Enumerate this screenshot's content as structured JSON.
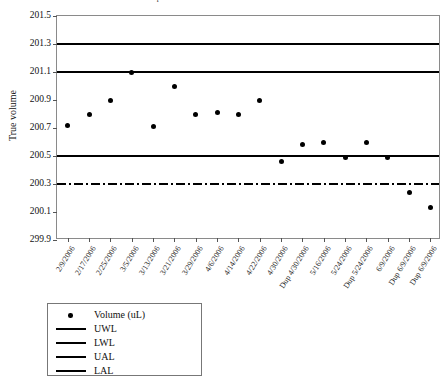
{
  "chart_data": {
    "type": "scatter",
    "title": "Pipette Performance Control Chart - Jan 2006",
    "xlabel": "",
    "ylabel": "True volume",
    "ylim": [
      199.9,
      201.5
    ],
    "ytick_labels": [
      "201.5",
      "201.3",
      "201.1",
      "200.9",
      "200.7",
      "200.5",
      "200.3",
      "200.1",
      "299.9"
    ],
    "ytick_values": [
      201.5,
      201.3,
      201.1,
      200.9,
      200.7,
      200.5,
      200.3,
      200.1,
      199.9
    ],
    "grid": false,
    "legend_position": "below-left",
    "categories": [
      "2/9/2006",
      "2/17/2006",
      "2/25/2006",
      "3/5/2006",
      "3/13/2006",
      "3/21/2006",
      "3/29/2006",
      "4/6/2006",
      "4/14/2006",
      "4/22/2006",
      "4/30/2006",
      "Dup 4/30/2006",
      "5/16/2006",
      "5/24/2006",
      "Dup 5/24/2006",
      "6/9/2006",
      "Dup 6/9/2006",
      "Dup 6/9/2006"
    ],
    "series": [
      {
        "name": "Volume (uL)",
        "marker": "circle",
        "color": "#000000",
        "values": [
          200.72,
          200.8,
          200.9,
          201.1,
          200.71,
          201.0,
          200.8,
          200.81,
          200.8,
          200.9,
          200.46,
          200.58,
          200.6,
          200.49,
          200.6,
          200.49,
          200.24,
          200.13
        ]
      }
    ],
    "reference_lines": [
      {
        "name": "UAL",
        "label": "UAL",
        "value": 201.3,
        "style": "dotted",
        "color": "#000000"
      },
      {
        "name": "UWL",
        "label": "UWL",
        "value": 201.1,
        "style": "solid",
        "color": "#000000"
      },
      {
        "name": "LWL",
        "label": "LWL",
        "value": 200.5,
        "style": "dashed",
        "color": "#000000"
      },
      {
        "name": "LAL",
        "label": "LAL",
        "value": 200.3,
        "style": "dashdot",
        "color": "#000000"
      }
    ],
    "legend": [
      {
        "label": "Volume (uL)",
        "key": "dot"
      },
      {
        "label": "UWL",
        "key": "solid"
      },
      {
        "label": "LWL",
        "key": "dashed"
      },
      {
        "label": "UAL",
        "key": "dotted"
      },
      {
        "label": "LAL",
        "key": "dashdot"
      }
    ]
  }
}
